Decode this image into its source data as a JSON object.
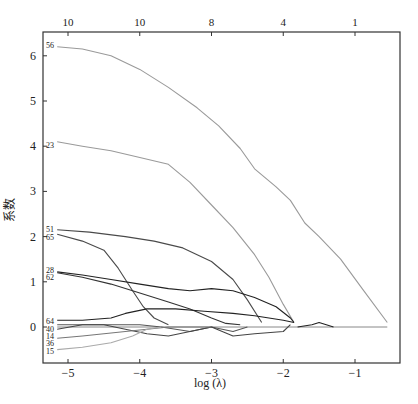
{
  "chart_data": {
    "type": "line",
    "title": "",
    "xlabel": "log (λ)",
    "ylabel": "系数",
    "xlim": [
      -5.35,
      -0.45
    ],
    "ylim": [
      -0.8,
      6.5
    ],
    "x_ticks": [
      -5,
      -4,
      -3,
      -2,
      -1
    ],
    "x_tick_labels": [
      "−5",
      "−4",
      "−3",
      "−2",
      "−1"
    ],
    "y_ticks": [
      0,
      1,
      2,
      3,
      4,
      5,
      6
    ],
    "y_tick_labels": [
      "0",
      "1",
      "2",
      "3",
      "4",
      "5",
      "6"
    ],
    "top_axis": {
      "positions": [
        -5,
        -4,
        -3,
        -2,
        -1
      ],
      "labels": [
        "10",
        "10",
        "8",
        "4",
        "1"
      ]
    },
    "grid": false,
    "legend": "inline labels at left edge",
    "series": [
      {
        "name": "56",
        "color": "#9a9a9a",
        "x": [
          -5.15,
          -4.8,
          -4.4,
          -4.0,
          -3.6,
          -3.2,
          -2.9,
          -2.6,
          -2.4,
          -2.1,
          -1.9,
          -1.7,
          -1.5,
          -1.2,
          -0.9,
          -0.55
        ],
        "y": [
          6.2,
          6.15,
          6.0,
          5.7,
          5.3,
          4.85,
          4.45,
          3.95,
          3.5,
          3.1,
          2.8,
          2.3,
          2.0,
          1.5,
          0.85,
          0.1
        ]
      },
      {
        "name": "23",
        "color": "#9a9a9a",
        "x": [
          -5.15,
          -4.8,
          -4.4,
          -4.0,
          -3.6,
          -3.3,
          -3.0,
          -2.7,
          -2.4,
          -2.2,
          -2.0,
          -1.85
        ],
        "y": [
          4.1,
          4.0,
          3.9,
          3.75,
          3.6,
          3.2,
          2.7,
          2.2,
          1.6,
          1.1,
          0.5,
          0.1
        ]
      },
      {
        "name": "51",
        "color": "#4a4a4a",
        "x": [
          -5.15,
          -4.7,
          -4.2,
          -3.8,
          -3.4,
          -3.0,
          -2.7,
          -2.5,
          -2.3
        ],
        "y": [
          2.15,
          2.1,
          2.0,
          1.9,
          1.75,
          1.45,
          1.05,
          0.6,
          0.1
        ]
      },
      {
        "name": "65",
        "color": "#4a4a4a",
        "x": [
          -5.15,
          -4.8,
          -4.5,
          -4.3,
          -4.1,
          -3.95,
          -3.8,
          -3.6
        ],
        "y": [
          2.05,
          1.9,
          1.7,
          1.3,
          0.8,
          0.45,
          0.2,
          0.05
        ]
      },
      {
        "name": "28",
        "color": "#222222",
        "x": [
          -5.15,
          -4.8,
          -4.4,
          -4.0,
          -3.6,
          -3.3,
          -3.0,
          -2.7,
          -2.4,
          -2.1,
          -1.9,
          -1.85
        ],
        "y": [
          1.22,
          1.15,
          1.05,
          0.95,
          0.85,
          0.8,
          0.85,
          0.8,
          0.65,
          0.45,
          0.2,
          0.1
        ]
      },
      {
        "name": "62",
        "color": "#333333",
        "x": [
          -5.15,
          -4.8,
          -4.4,
          -4.0,
          -3.6,
          -3.3,
          -3.0,
          -2.8,
          -2.6
        ],
        "y": [
          1.2,
          1.1,
          0.95,
          0.75,
          0.55,
          0.4,
          0.2,
          0.08,
          0.05
        ]
      },
      {
        "name": "64",
        "color": "#222222",
        "x": [
          -5.15,
          -4.8,
          -4.4,
          -4.2,
          -3.9,
          -3.5,
          -3.1,
          -2.7,
          -2.4,
          -2.0,
          -1.85
        ],
        "y": [
          0.15,
          0.15,
          0.2,
          0.3,
          0.4,
          0.4,
          0.35,
          0.3,
          0.25,
          0.15,
          0.1
        ]
      },
      {
        "name": "40",
        "color": "#555555",
        "x": [
          -5.15,
          -4.8,
          -4.4,
          -4.0,
          -3.7,
          -3.3,
          -3.0,
          -2.7,
          -2.5
        ],
        "y": [
          0.05,
          0.05,
          0.05,
          0.05,
          0.0,
          -0.1,
          0.0,
          -0.1,
          0.0
        ]
      },
      {
        "name": "14",
        "color": "#444444",
        "x": [
          -5.15,
          -4.8,
          -4.5,
          -4.2,
          -3.9,
          -3.6,
          -3.3,
          -3.0,
          -2.7,
          -2.4,
          -2.0,
          -1.9
        ],
        "y": [
          -0.05,
          0.05,
          0.05,
          -0.05,
          -0.15,
          -0.2,
          -0.1,
          0.0,
          -0.2,
          -0.15,
          -0.1,
          0.05
        ]
      },
      {
        "name": "36",
        "color": "#777777",
        "x": [
          -5.15,
          -4.8,
          -4.5,
          -4.2,
          -3.9,
          -3.6,
          -3.3,
          -3.0
        ],
        "y": [
          -0.25,
          -0.2,
          -0.15,
          -0.1,
          -0.05,
          0.0,
          0.0,
          0.0
        ]
      },
      {
        "name": "15",
        "color": "#aaaaaa",
        "x": [
          -5.15,
          -4.8,
          -4.4,
          -4.1,
          -3.9,
          -3.7
        ],
        "y": [
          -0.5,
          -0.45,
          -0.35,
          -0.2,
          -0.05,
          0.0
        ]
      },
      {
        "name": "short-peak",
        "color": "#222222",
        "x": [
          -1.8,
          -1.6,
          -1.5,
          -1.4,
          -1.3
        ],
        "y": [
          0.0,
          0.05,
          0.1,
          0.05,
          0.0
        ]
      }
    ],
    "zero_line": {
      "x": [
        -5.15,
        -0.55
      ],
      "y": [
        0,
        0
      ]
    },
    "caption": ""
  }
}
